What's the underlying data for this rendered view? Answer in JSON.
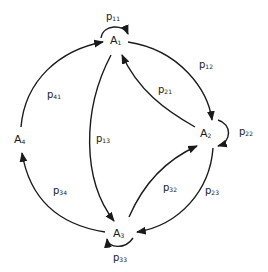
{
  "diagram": {
    "type": "state-transition-graph",
    "stroke_color": "#1a1a1a",
    "nodes": [
      {
        "id": "A1",
        "base": "A",
        "sub": "1"
      },
      {
        "id": "A2",
        "base": "A",
        "sub": "2"
      },
      {
        "id": "A3",
        "base": "A",
        "sub": "3"
      },
      {
        "id": "A4",
        "base": "A",
        "sub": "4"
      }
    ],
    "edges": [
      {
        "from": "A1",
        "to": "A1",
        "base": "p",
        "sub": "11"
      },
      {
        "from": "A1",
        "to": "A2",
        "base": "p",
        "sub": "12"
      },
      {
        "from": "A2",
        "to": "A1",
        "base": "p",
        "sub": "21"
      },
      {
        "from": "A2",
        "to": "A2",
        "base": "p",
        "sub": "22"
      },
      {
        "from": "A1",
        "to": "A3",
        "base": "p",
        "sub": "13"
      },
      {
        "from": "A3",
        "to": "A2",
        "base": "p",
        "sub": "32"
      },
      {
        "from": "A2",
        "to": "A3",
        "base": "p",
        "sub": "23"
      },
      {
        "from": "A3",
        "to": "A3",
        "base": "p",
        "sub": "33"
      },
      {
        "from": "A3",
        "to": "A4",
        "base": "p",
        "sub": "34"
      },
      {
        "from": "A4",
        "to": "A1",
        "base": "p",
        "sub": "41"
      }
    ]
  }
}
